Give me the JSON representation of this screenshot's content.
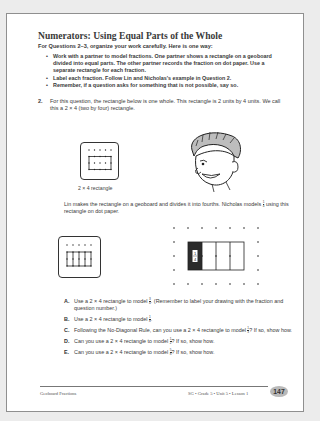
{
  "page": {
    "title": "Numerators: Using Equal Parts of the Whole",
    "intro": "For Questions 2–3, organize your work carefully. Here is one way:",
    "bullets": [
      "Work with a partner to model fractions. One partner shows a rectangle on a geoboard divided into equal parts. The other partner records the fraction on dot paper. Use a separate rectangle for each fraction.",
      "Label each fraction. Follow Lin and Nicholas's example in Question 2.",
      "Remember, if a question asks for something that is not possible, say so."
    ],
    "question2": {
      "number": "2.",
      "text": "For this question, the rectangle below is one whole. This rectangle is 2 units by 4 units. We call this a 2 × 4 (two by four) rectangle."
    },
    "figure1_caption": "2 × 4 rectangle",
    "paragraph": {
      "before": "Lin makes the rectangle on a geoboard and divides it into fourths. Nicholas models",
      "fraction": {
        "num": "1",
        "den": "4"
      },
      "after": "using this rectangle on dot paper."
    },
    "shaded_label": {
      "num": "1",
      "den": "4"
    },
    "parts": [
      {
        "label": "A.",
        "before": "Use a 2 × 4 rectangle to model",
        "fraction": {
          "num": "3",
          "den": "4"
        },
        "after": ". (Remember to label your drawing with the fraction and question number.)"
      },
      {
        "label": "B.",
        "before": "Use a 2 × 4 rectangle to model",
        "fraction": {
          "num": "1",
          "den": "8"
        },
        "after": "."
      },
      {
        "label": "C.",
        "before": "Following the No-Diagonal Rule, can you use a 2 × 4 rectangle to model",
        "fraction": {
          "num": "1",
          "den": "3"
        },
        "after": "? If so, show how."
      },
      {
        "label": "D.",
        "before": "Can you use a 2 × 4 rectangle to model",
        "fraction": {
          "num": "1",
          "den": "2"
        },
        "after": "? If so, show how."
      },
      {
        "label": "E.",
        "before": "Can you use a 2 × 4 rectangle to model",
        "fraction": {
          "num": "5",
          "den": "8"
        },
        "after": "? If so, show how."
      }
    ],
    "footer": {
      "left": "Geoboard Fractions",
      "right": "SG • Grade 5 • Unit 5 • Lesson 1",
      "page_number": "147"
    },
    "colors": {
      "page_bg": "#ffffff",
      "shaded_fill": "#2b2b2b",
      "badge_bg": "#b9b9b9"
    }
  }
}
